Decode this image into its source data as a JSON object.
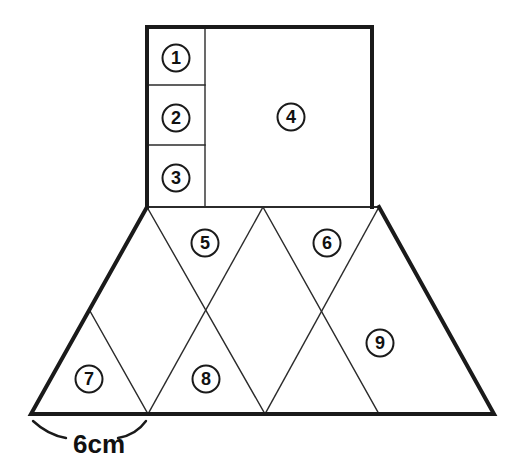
{
  "figure": {
    "stroke_color": "#1a1a1a",
    "fill_color": "#ffffff",
    "outline_width": 4,
    "inner_width": 1.4,
    "dimension_label": "6cm",
    "dimension_label_x": 99,
    "dimension_label_y": 444,
    "faces": [
      {
        "id": "1",
        "label": "1",
        "cx": 176,
        "cy": 58,
        "shape": "rectangle-cell"
      },
      {
        "id": "2",
        "label": "2",
        "cx": 176,
        "cy": 118,
        "shape": "rectangle-cell"
      },
      {
        "id": "3",
        "label": "3",
        "cx": 176,
        "cy": 178,
        "shape": "rectangle-cell"
      },
      {
        "id": "4",
        "label": "4",
        "cx": 291,
        "cy": 117,
        "shape": "rectangle-cell"
      },
      {
        "id": "5",
        "label": "5",
        "cx": 205,
        "cy": 243,
        "shape": "triangle-up"
      },
      {
        "id": "6",
        "label": "6",
        "cx": 327,
        "cy": 243,
        "shape": "triangle-up"
      },
      {
        "id": "7",
        "label": "7",
        "cx": 89,
        "cy": 379,
        "shape": "triangle-down"
      },
      {
        "id": "8",
        "label": "8",
        "cx": 206,
        "cy": 379,
        "shape": "triangle-down"
      },
      {
        "id": "9",
        "label": "9",
        "cx": 380,
        "cy": 343,
        "shape": "triangle-down"
      }
    ],
    "rectangle": {
      "left": 147,
      "top": 27,
      "right": 372,
      "bottom": 207,
      "column_divider_x": 205,
      "row_divider_y": [
        85,
        145
      ]
    },
    "trapezoid": {
      "bottom_left": {
        "x": 31,
        "y": 414
      },
      "top_left": {
        "x": 147,
        "y": 207
      },
      "top_right": {
        "x": 379,
        "y": 207
      },
      "bottom_right": {
        "x": 494,
        "y": 414
      },
      "top_vertices": [
        147,
        263,
        379
      ],
      "bottom_vertices": [
        148,
        265,
        379
      ],
      "crossings": [
        {
          "x": 90,
          "y": 311
        },
        {
          "x": 206,
          "y": 311
        },
        {
          "x": 322,
          "y": 311
        }
      ]
    }
  }
}
